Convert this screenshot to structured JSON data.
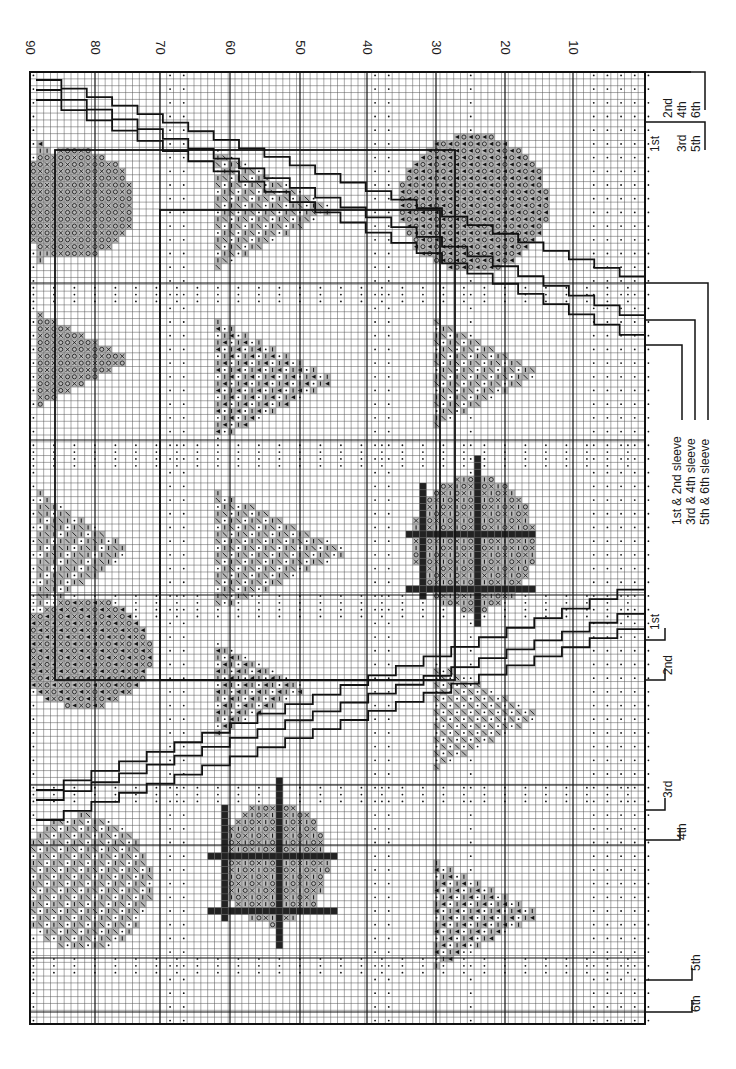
{
  "chart": {
    "orientation": "rotated 90 degrees; rows run top-to-bottom along x axis",
    "row_labels": [
      "90",
      "80",
      "70",
      "60",
      "50",
      "40",
      "30",
      "20",
      "10"
    ],
    "grid": {
      "left": 30,
      "top": 72,
      "right": 645,
      "bottom": 1024,
      "cell_px": 6.85
    },
    "colors": {
      "grid_line": "#555555",
      "major_line": "#111111",
      "motif_fill": "#b8b8b8",
      "solid": "#222222",
      "paper": "#ffffff"
    }
  },
  "legend": {
    "sleeve_lines": [
      "1st & 2nd sleeve",
      "3rd & 4th sleeve",
      "5th & 6th sleeve"
    ],
    "top_right_sizes": {
      "upper": [
        "2nd",
        "4th",
        "6th"
      ],
      "lower": [
        "1st",
        "3rd",
        "5th"
      ]
    },
    "bottom_sizes": [
      "1st",
      "2nd",
      "3rd",
      "4th",
      "5th",
      "6th"
    ]
  },
  "symbols": {
    "dot": "background stitch (dot)",
    "circle": "o stitch",
    "cross": "x stitch",
    "bar": "vertical bar stitch",
    "triangle": "left-pointing triangle",
    "diagonal": "slanted stitch",
    "solid": "filled square"
  }
}
